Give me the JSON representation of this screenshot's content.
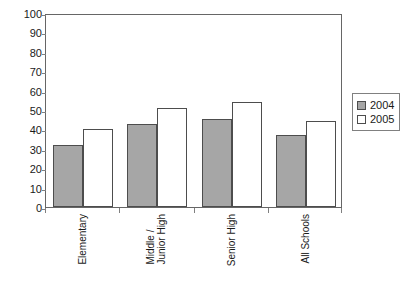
{
  "chart_data": {
    "type": "bar",
    "title": "",
    "subtitle": "",
    "xlabel": "",
    "ylabel": "",
    "categories": [
      "Elementary",
      "Middle / Junior High",
      "Senior High",
      "All Schools"
    ],
    "category_lines": [
      [
        "Elementary"
      ],
      [
        "Middle /",
        "Junior High"
      ],
      [
        "Senior High"
      ],
      [
        "All Schools"
      ]
    ],
    "series": [
      {
        "name": "2004",
        "values": [
          32,
          43,
          45.5,
          37
        ],
        "color": "#a6a6a6"
      },
      {
        "name": "2005",
        "values": [
          40,
          51,
          54,
          44.5
        ],
        "color": "#ffffff"
      }
    ],
    "ylim": [
      0,
      100
    ],
    "ytick_values": [
      100,
      90,
      80,
      70,
      60,
      50,
      40,
      30,
      20,
      10,
      0
    ],
    "ytick_labels": [
      "100",
      "90",
      "80",
      "70",
      "60",
      "50",
      "40",
      "30",
      "20",
      "10",
      "0"
    ],
    "grid": false,
    "legend_position": "right",
    "legend_entries": [
      "2004",
      "2005"
    ],
    "bar_outline_color": "#4d4d4d",
    "frame_color": "#666666"
  }
}
